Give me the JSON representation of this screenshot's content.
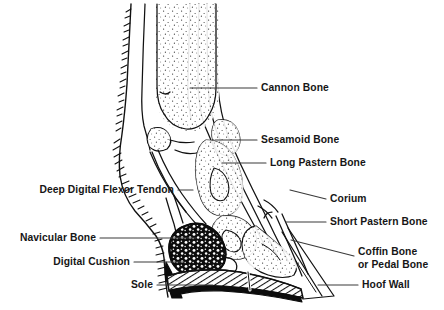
{
  "figure": {
    "width": 444,
    "height": 310,
    "background_color": "#ffffff",
    "ink_color": "#111111",
    "label_color": "#161616",
    "leader_line_color": "#3a3a3a"
  },
  "labels": {
    "cannon_bone": "Cannon Bone",
    "sesamoid_bone": "Sesamoid Bone",
    "long_pastern_bone": "Long Pastern Bone",
    "corium": "Corium",
    "short_pastern_bone": "Short Pastern Bone",
    "coffin_bone_line1": "Coffin Bone",
    "coffin_bone_line2": "or Pedal Bone",
    "hoof_wall": "Hoof Wall",
    "deep_digital_flexor_tendon": "Deep Digital Flexor Tendon",
    "navicular_bone": "Navicular Bone",
    "digital_cushion": "Digital Cushion",
    "sole": "Sole"
  },
  "structures": [
    {
      "name": "cannon-bone",
      "side": "right",
      "fill": "white",
      "texture": "stipple"
    },
    {
      "name": "sesamoid-bone",
      "side": "right",
      "fill": "white",
      "texture": "stipple"
    },
    {
      "name": "long-pastern-bone",
      "side": "right",
      "fill": "white",
      "texture": "stipple"
    },
    {
      "name": "short-pastern-bone",
      "side": "right",
      "fill": "white",
      "texture": "stipple"
    },
    {
      "name": "coffin-bone",
      "side": "right",
      "fill": "white",
      "texture": "stipple"
    },
    {
      "name": "navicular-bone",
      "side": "left",
      "fill": "white",
      "texture": "stipple"
    },
    {
      "name": "digital-cushion",
      "side": "left",
      "fill": "black",
      "texture": "mottled"
    },
    {
      "name": "sole",
      "side": "bottom",
      "fill": "white",
      "texture": "diagonal-hatch"
    },
    {
      "name": "hoof-wall",
      "side": "right",
      "fill": "white",
      "texture": "outline"
    },
    {
      "name": "corium",
      "side": "right",
      "fill": "white",
      "texture": "outline"
    },
    {
      "name": "deep-digital-flexor-tendon",
      "side": "left",
      "fill": "white",
      "texture": "outline"
    }
  ]
}
